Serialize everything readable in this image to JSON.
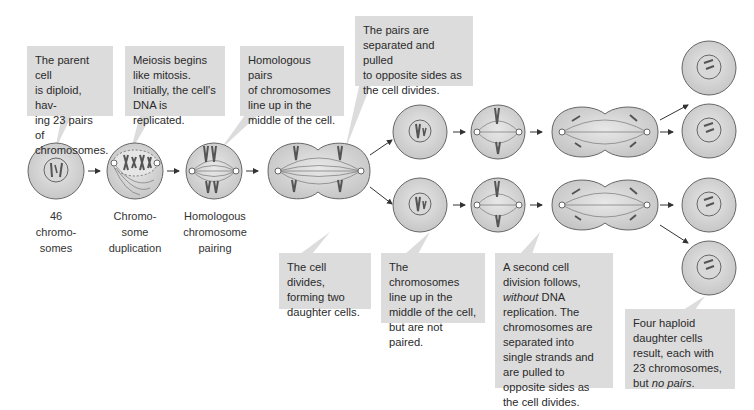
{
  "title": "Meiosis",
  "callouts": {
    "parent": {
      "lines": [
        "The parent cell",
        "is diploid, hav-",
        "ing 23 pairs of",
        "chromosomes."
      ]
    },
    "begins": {
      "lines": [
        "Meiosis begins",
        "like mitosis.",
        "Initially, the cell's",
        "DNA is replicated."
      ]
    },
    "pairs_line_up": {
      "lines": [
        "Homologous pairs",
        "of chromosomes",
        "line up in the",
        "middle of the cell."
      ]
    },
    "pairs_separated": {
      "lines": [
        "The pairs are",
        "separated and pulled",
        "to opposite sides as",
        "the cell divides."
      ]
    },
    "cell_divides": {
      "lines": [
        "The cell divides,",
        "forming two",
        "daughter cells."
      ]
    },
    "not_paired": {
      "lines": [
        "The chromosomes",
        "line up in the",
        "middle of the cell,",
        "but are not paired."
      ]
    },
    "second_division": {
      "pre": "A second cell division follows, ",
      "em": "without",
      "post": " DNA replication. The chromosomes are separated into single strands and are pulled to opposite sides as the cell divides."
    },
    "four_haploid": {
      "pre": "Four haploid daughter cells result, each with 23 chromosomes, but ",
      "em": "no pairs",
      "post": "."
    }
  },
  "labels": {
    "stage1": [
      "46",
      "chromo-",
      "somes"
    ],
    "stage2": [
      "Chromo-",
      "some",
      "duplication"
    ],
    "stage3": [
      "Homologous",
      "chromosome",
      "pairing"
    ]
  },
  "colors": {
    "callout_bg": "#dcdcdc",
    "cell_fill": "#d4d4d4",
    "cell_stroke": "#666666",
    "chromosome": "#555555",
    "text": "#2a2a2a"
  }
}
